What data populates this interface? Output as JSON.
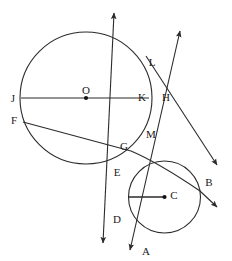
{
  "figure": {
    "stroke_color": "#2b2b2b",
    "background_color": "#ffffff",
    "label_color": "#1a1a1a"
  },
  "circles": [
    {
      "name": "circle-O",
      "center_label": "O",
      "cx": 86,
      "cy": 98,
      "r": 66
    },
    {
      "name": "circle-C",
      "center_label": "C",
      "cx": 164.5,
      "cy": 197,
      "r": 36
    }
  ],
  "points": [
    {
      "id": "J",
      "label": "J",
      "x": 13,
      "y": 98
    },
    {
      "id": "O",
      "label": "O",
      "x": 86,
      "y": 90
    },
    {
      "id": "K",
      "label": "K",
      "x": 142,
      "y": 97
    },
    {
      "id": "H",
      "label": "H",
      "x": 166,
      "y": 97
    },
    {
      "id": "L",
      "label": "L",
      "x": 152,
      "y": 62
    },
    {
      "id": "F",
      "label": "F",
      "x": 14,
      "y": 120
    },
    {
      "id": "G",
      "label": "G",
      "x": 124,
      "y": 146
    },
    {
      "id": "M",
      "label": "M",
      "x": 151,
      "y": 134
    },
    {
      "id": "E",
      "label": "E",
      "x": 117,
      "y": 172
    },
    {
      "id": "D",
      "label": "D",
      "x": 117,
      "y": 219
    },
    {
      "id": "C",
      "label": "C",
      "x": 174,
      "y": 195
    },
    {
      "id": "B",
      "label": "B",
      "x": 209,
      "y": 182
    },
    {
      "id": "A",
      "label": "A",
      "x": 146,
      "y": 251
    }
  ],
  "segments": [
    {
      "name": "diameter-JK",
      "from": "J",
      "to": "K",
      "x1": 21,
      "y1": 98,
      "x2": 149,
      "y2": 98
    },
    {
      "name": "chord-FG",
      "from": "F",
      "to": "G",
      "x1": 23,
      "y1": 122,
      "x2": 131,
      "y2": 151
    },
    {
      "name": "radius-C",
      "from": "circle-C-left",
      "to": "C",
      "x1": 129,
      "y1": 197,
      "x2": 164,
      "y2": 197
    }
  ],
  "lines": [
    {
      "name": "line-LD",
      "description": "double-arrow line through L, M, E, D tangent-secant",
      "x1": 114,
      "y1": 13,
      "x2": 103,
      "y2": 243,
      "arrow_start": true,
      "arrow_end": true
    },
    {
      "name": "line-HA",
      "description": "double-arrow line through H and A",
      "x1": 180,
      "y1": 31,
      "x2": 130,
      "y2": 250,
      "arrow_start": true,
      "arrow_end": true
    },
    {
      "name": "line-LB-upper",
      "description": "ray from tangent point region through B toward upper right",
      "x1": 146,
      "y1": 56,
      "x2": 217,
      "y2": 165,
      "arrow_start": false,
      "arrow_end": true
    },
    {
      "name": "line-GB-lower",
      "description": "curve-like ray from G region through B toward lower right",
      "x1": 131,
      "y1": 151,
      "x2": 217,
      "y2": 207,
      "arrow_start": false,
      "arrow_end": true
    }
  ],
  "center_dots": [
    {
      "name": "dot-O",
      "x": 86,
      "y": 98
    },
    {
      "name": "dot-C",
      "x": 164.5,
      "y": 197
    }
  ]
}
